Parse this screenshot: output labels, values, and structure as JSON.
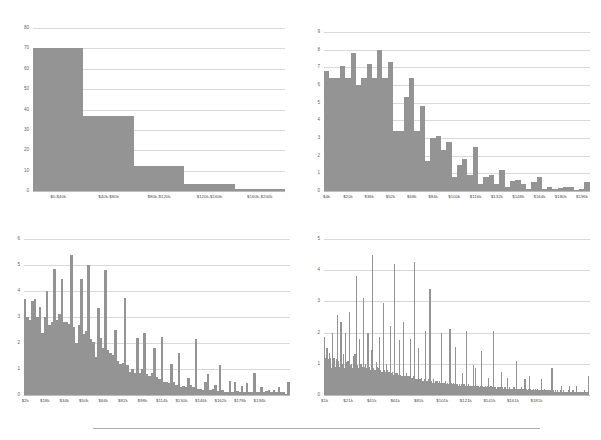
{
  "figure": {
    "title": "",
    "panel_count": 4,
    "bar_color": "#949494",
    "grid_color": "#d9d9d9",
    "background": "#ffffff",
    "divider_color": "#b0b0b0"
  },
  "chart_data": [
    {
      "id": "panel-top-left",
      "type": "bar",
      "title": "",
      "xlabel": "",
      "ylabel": "",
      "grid": true,
      "legend": null,
      "ylim": [
        0,
        80
      ],
      "yticks": [
        0,
        10,
        20,
        30,
        40,
        50,
        60,
        70,
        80
      ],
      "ytick_labels": [
        "0",
        "10",
        "20",
        "30",
        "40",
        "50",
        "60",
        "70",
        "80"
      ],
      "categories": [
        "$0-$40k",
        "$40k-$80k",
        "$80k-$120k",
        "$120k-$160k",
        "$160k-$200k"
      ],
      "xtick_labels": [
        "$0-$40k",
        "$40k-$80k",
        "$80k-$120k",
        "$120k-$160k",
        "$160k-$200k"
      ],
      "values": [
        70,
        37,
        12.5,
        3.5,
        0.8
      ]
    },
    {
      "id": "panel-top-right",
      "type": "bar",
      "title": "",
      "xlabel": "",
      "ylabel": "",
      "grid": true,
      "legend": null,
      "ylim": [
        0,
        9
      ],
      "yticks": [
        0,
        1,
        2,
        3,
        4,
        5,
        6,
        7,
        8,
        9
      ],
      "ytick_labels": [
        "0",
        "1",
        "2",
        "3",
        "4",
        "5",
        "6",
        "7",
        "8",
        "9"
      ],
      "xtick_labels": [
        "$4k",
        "$20k",
        "$36k",
        "$52k",
        "$68k",
        "$84k",
        "$100k",
        "$116k",
        "$132k",
        "$148k",
        "$164k",
        "$180k",
        "$196k"
      ],
      "xtick_positions": [
        0.5,
        4.5,
        8.5,
        12.5,
        16.5,
        20.5,
        24.5,
        28.5,
        32.5,
        36.5,
        40.5,
        44.5,
        48.5
      ],
      "bin_count": 50,
      "values": [
        6.8,
        6.4,
        6.4,
        7.1,
        6.4,
        7.8,
        6.0,
        6.4,
        7.2,
        6.4,
        8.0,
        6.4,
        7.3,
        3.4,
        3.4,
        5.3,
        6.4,
        3.4,
        4.8,
        1.7,
        3.0,
        3.1,
        2.3,
        2.8,
        0.8,
        1.5,
        1.8,
        0.9,
        2.5,
        0.4,
        0.8,
        0.9,
        0.4,
        1.2,
        0.2,
        0.55,
        0.6,
        0.4,
        0.1,
        0.5,
        0.8,
        0.1,
        0.25,
        0.1,
        0.15,
        0.2,
        0.2,
        0.05,
        0.1,
        0.5
      ]
    },
    {
      "id": "panel-bottom-left",
      "type": "bar",
      "title": "",
      "xlabel": "",
      "ylabel": "",
      "grid": true,
      "legend": null,
      "ylim": [
        0,
        6
      ],
      "yticks": [
        0,
        1,
        2,
        3,
        4,
        5,
        6
      ],
      "ytick_labels": [
        "0",
        "1",
        "2",
        "3",
        "4",
        "5",
        "6"
      ],
      "xtick_labels": [
        "$2k",
        "$18k",
        "$34k",
        "$50k",
        "$66k",
        "$82k",
        "$98k",
        "$114k",
        "$130k",
        "$146k",
        "$162k",
        "$178k",
        "$194k"
      ],
      "xtick_positions": [
        0.5,
        8.5,
        16.5,
        24.5,
        32.5,
        40.5,
        48.5,
        56.5,
        64.5,
        72.5,
        80.5,
        88.5,
        96.5
      ],
      "bin_count": 100,
      "values": [
        3.7,
        3.0,
        2.9,
        3.6,
        3.7,
        3.0,
        3.4,
        2.4,
        3.0,
        4.0,
        2.7,
        2.8,
        4.85,
        2.9,
        3.1,
        4.45,
        2.8,
        2.8,
        2.75,
        5.4,
        2.6,
        2.0,
        2.7,
        4.45,
        2.35,
        2.45,
        5.0,
        2.15,
        2.05,
        1.45,
        3.35,
        2.2,
        1.8,
        4.8,
        1.75,
        1.6,
        1.55,
        2.5,
        1.3,
        1.2,
        1.25,
        3.75,
        1.15,
        0.9,
        1.0,
        0.85,
        2.2,
        0.85,
        1.0,
        2.4,
        0.8,
        0.75,
        0.85,
        1.8,
        0.7,
        0.6,
        2.25,
        0.5,
        0.5,
        0.45,
        1.2,
        0.5,
        0.4,
        1.6,
        0.3,
        0.35,
        0.3,
        0.65,
        0.4,
        0.3,
        2.15,
        0.25,
        0.25,
        0.2,
        0.5,
        0.8,
        0.2,
        0.25,
        0.4,
        0.15,
        1.15,
        0.2,
        0.1,
        0.1,
        0.55,
        0.1,
        0.5,
        0.15,
        0.1,
        0.35,
        0.1,
        0.45,
        0.1,
        0.1,
        0.85,
        0.1,
        0.1,
        0.3,
        0.1,
        0.15,
        0.2,
        0.1,
        0.2,
        0.1,
        0.3,
        0.1,
        0.1,
        0.05,
        0.5
      ]
    },
    {
      "id": "panel-bottom-right",
      "type": "bar",
      "title": "",
      "xlabel": "",
      "ylabel": "",
      "grid": true,
      "legend": null,
      "ylim": [
        0,
        5
      ],
      "yticks": [
        0,
        1,
        2,
        3,
        4,
        5
      ],
      "ytick_labels": [
        "0",
        "1",
        "2",
        "3",
        "4",
        "5"
      ],
      "xtick_labels": [
        "$1k",
        "$21k",
        "$41k",
        "$61k",
        "$81k",
        "$101k",
        "$121k",
        "$141k",
        "$161k",
        "$181k"
      ],
      "xtick_positions": [
        0.5,
        20.5,
        40.5,
        60.5,
        80.5,
        100.5,
        120.5,
        140.5,
        160.5,
        180.5
      ],
      "bin_count": 200,
      "values": [
        1.85,
        1.2,
        1.5,
        1.15,
        1.35,
        1.2,
        0.85,
        2.0,
        1.2,
        0.9,
        1.15,
        2.55,
        1.1,
        0.9,
        2.35,
        1.0,
        1.3,
        0.85,
        2.0,
        1.05,
        1.1,
        2.65,
        0.95,
        1.0,
        0.85,
        1.25,
        1.3,
        3.8,
        0.95,
        0.85,
        1.8,
        1.0,
        0.9,
        3.1,
        0.9,
        1.0,
        0.85,
        2.0,
        0.9,
        0.8,
        1.45,
        4.5,
        0.85,
        0.8,
        1.05,
        0.9,
        0.85,
        1.85,
        0.8,
        0.75,
        2.95,
        0.8,
        0.75,
        1.0,
        0.8,
        0.75,
        2.2,
        0.7,
        0.75,
        0.65,
        4.2,
        0.7,
        0.7,
        0.65,
        1.75,
        0.65,
        0.6,
        2.35,
        0.6,
        0.6,
        0.7,
        0.6,
        0.6,
        1.8,
        0.55,
        0.55,
        0.6,
        4.25,
        0.5,
        0.5,
        1.5,
        0.5,
        0.5,
        0.55,
        0.45,
        0.5,
        2.05,
        0.45,
        0.45,
        0.5,
        3.4,
        0.45,
        0.4,
        0.5,
        0.4,
        0.45,
        0.45,
        0.4,
        0.45,
        0.4,
        2.0,
        0.4,
        0.4,
        0.45,
        0.35,
        0.4,
        0.35,
        2.1,
        0.4,
        0.35,
        0.4,
        0.35,
        1.55,
        0.35,
        0.3,
        0.35,
        0.3,
        0.35,
        0.7,
        0.35,
        0.3,
        2.05,
        0.3,
        0.35,
        0.3,
        0.3,
        0.3,
        0.95,
        0.3,
        0.85,
        0.3,
        0.3,
        0.25,
        0.3,
        1.4,
        0.3,
        0.25,
        0.3,
        0.25,
        0.3,
        0.55,
        0.25,
        0.3,
        0.25,
        2.05,
        0.25,
        0.25,
        0.2,
        0.25,
        0.25,
        0.25,
        0.75,
        0.25,
        0.2,
        0.25,
        0.2,
        0.55,
        0.2,
        0.25,
        0.2,
        0.2,
        0.25,
        0.25,
        0.2,
        1.1,
        0.2,
        0.2,
        0.2,
        0.25,
        0.2,
        0.2,
        0.5,
        0.2,
        0.15,
        0.2,
        0.6,
        0.2,
        0.15,
        0.2,
        0.15,
        0.2,
        0.15,
        0.2,
        0.15,
        0.15,
        0.5,
        0.15,
        0.15,
        0.2,
        0.15,
        0.15,
        0.15,
        0.15,
        0.15,
        0.85,
        0.15,
        0.1,
        0.15,
        0.1,
        0.15,
        0.1,
        0.15,
        0.3,
        0.1,
        0.15,
        0.1,
        0.1,
        0.1,
        0.15,
        0.3,
        0.1,
        0.1,
        0.15,
        0.1,
        0.1,
        0.3,
        0.1,
        0.1,
        0.1,
        0.1,
        0.1,
        0.1,
        0.15,
        0.1,
        0.1,
        0.6
      ]
    }
  ]
}
